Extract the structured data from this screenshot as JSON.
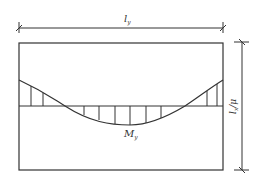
{
  "diagram": {
    "type": "bending-moment-diagram",
    "labels": {
      "top_dimension": {
        "main": "l",
        "sub": "y"
      },
      "right_dimension": {
        "main": "l",
        "sub": "x",
        "suffix": "/μ"
      },
      "moment": {
        "main": "M",
        "sub": "y"
      }
    },
    "colors": {
      "line": "#333333",
      "background": "#ffffff"
    }
  }
}
